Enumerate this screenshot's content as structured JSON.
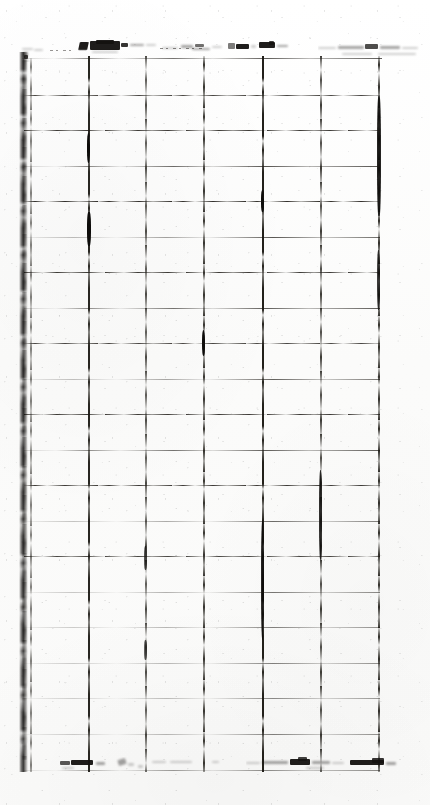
{
  "document": {
    "kind": "scanned-ruled-form",
    "condition": "heavily degraded photocopy, low contrast, broken rules, ink smudging",
    "page_background_color": "#fdfdfc",
    "ink_color": "#17150f",
    "width_px": 430,
    "height_px": 805
  },
  "header": {
    "legible": false,
    "transcription": "[illegible]",
    "note": "handwritten/typed header band, smudged beyond recognition",
    "fields": [
      {
        "name": "header-field-1",
        "text": "[illegible]"
      },
      {
        "name": "header-field-2",
        "text": "[illegible]"
      },
      {
        "name": "header-field-3",
        "text": "[illegible]"
      },
      {
        "name": "header-field-4",
        "text": "[illegible]"
      }
    ]
  },
  "table": {
    "legible": false,
    "column_count": 6,
    "row_count": 20,
    "cells_empty": true,
    "column_edges_px": [
      30,
      88,
      145,
      203,
      262,
      320,
      378
    ],
    "row_top_px": 60,
    "row_height_px": 35.5,
    "columns": [
      {
        "index": 1,
        "header": "[illegible]"
      },
      {
        "index": 2,
        "header": "[illegible]"
      },
      {
        "index": 3,
        "header": "[illegible]"
      },
      {
        "index": 4,
        "header": "[illegible]"
      },
      {
        "index": 5,
        "header": "[illegible]"
      },
      {
        "index": 6,
        "header": "[illegible]"
      }
    ]
  },
  "footer": {
    "legible": false,
    "left_text": "[illegible]",
    "right_text": "[illegible]"
  },
  "artifacts": {
    "binding_edge": "dark vertical band along left margin",
    "speckle": "scanner dust and toner specks throughout"
  }
}
